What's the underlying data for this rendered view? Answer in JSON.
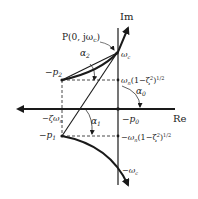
{
  "axes": {
    "im_label": "Im",
    "re_label": "Re"
  },
  "points": {
    "P": "P(0, jω",
    "P_sub": "c",
    "P_close": ")",
    "wc": "ω",
    "wc_sub": "c",
    "neg_wc": "−ω",
    "neg_wc_sub": "c",
    "p2": "−p",
    "p2_sub": "2",
    "p1": "−p",
    "p1_sub": "1",
    "p0": "−p",
    "p0_sub": "0",
    "zeta_wn": "−ζω",
    "zeta_wn_sub": "n"
  },
  "labels": {
    "upper_im": "ω",
    "upper_im_sub": "n",
    "upper_im_rest": "(1−ζ",
    "upper_im_sup": "2",
    "upper_im_close": ")",
    "upper_im_pow": "1/2",
    "lower_im": "−ω",
    "lower_im_sub": "n",
    "lower_im_rest": "(1−ζ",
    "lower_im_sup": "2",
    "lower_im_close": ")",
    "lower_im_pow": "1/2"
  },
  "angles": {
    "a0": "α",
    "a0_sub": "0",
    "a1": "α",
    "a1_sub": "1",
    "a2": "α",
    "a2_sub": "2"
  },
  "colors": {
    "line": "#1a1a1a"
  }
}
